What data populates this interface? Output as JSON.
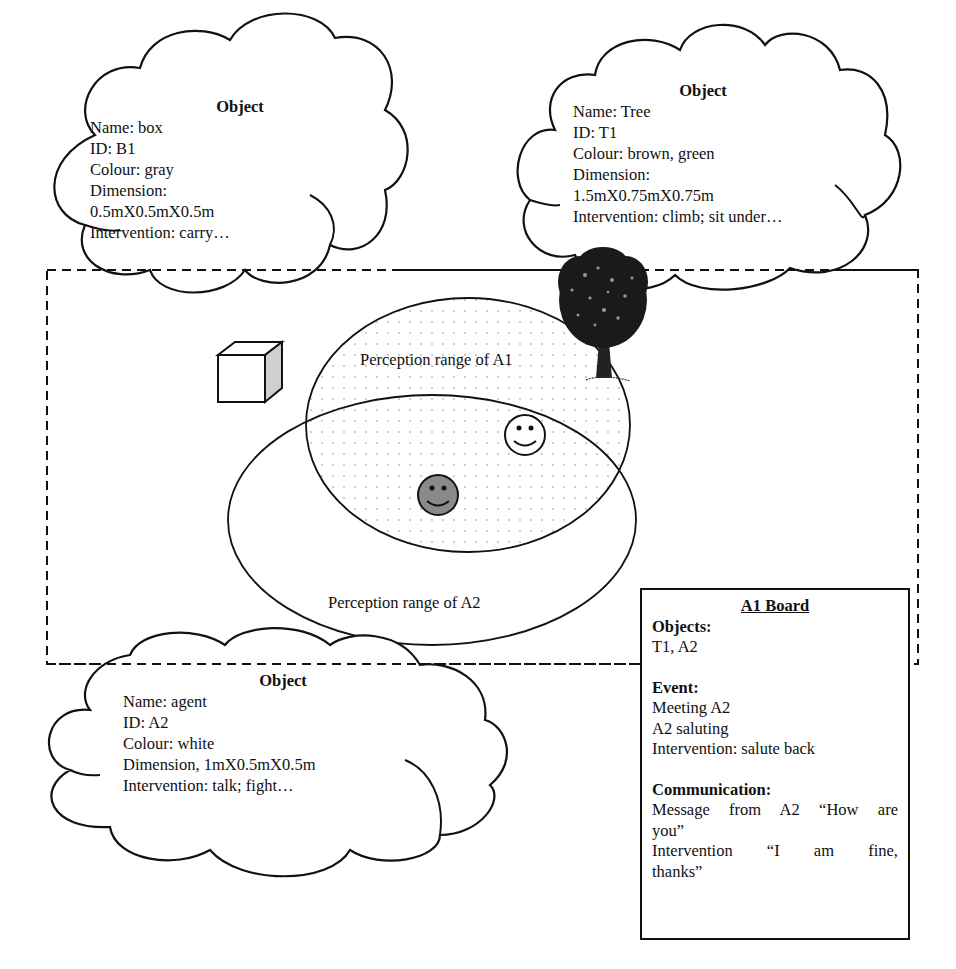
{
  "colors": {
    "stroke": "#111111",
    "agent_a2_fill": "#8a8a8a",
    "box_side_fill": "#cfcfcf",
    "perception_dots": "#bdbdbd",
    "background": "#ffffff"
  },
  "objects": [
    {
      "title": "Object",
      "lines": [
        "Name: box",
        "ID: B1",
        "Colour: gray",
        "Dimension:",
        "0.5mX0.5mX0.5m",
        "Intervention: carry…"
      ]
    },
    {
      "title": "Object",
      "lines": [
        "Name: Tree",
        "ID: T1",
        "Colour: brown, green",
        "Dimension:",
        "1.5mX0.75mX0.75m",
        "Intervention: climb; sit under…"
      ]
    },
    {
      "title": "Object",
      "lines": [
        "Name: agent",
        "ID: A2",
        "Colour: white",
        "Dimension, 1mX0.5mX0.5m",
        "Intervention: talk; fight…"
      ]
    }
  ],
  "scene": {
    "perception_a1_label": "Perception range of A1",
    "perception_a2_label": "Perception range of A2",
    "icons": [
      "box-icon",
      "tree-icon",
      "agent-a1-smiley-icon",
      "agent-a2-smiley-icon"
    ]
  },
  "board": {
    "title": "A1 Board",
    "objects_heading": "Objects:",
    "objects_value": "T1, A2",
    "event_heading": "Event:",
    "event_lines": [
      "Meeting A2",
      "A2 saluting",
      "Intervention: salute back"
    ],
    "communication_heading": "Communication:",
    "communication_line1": "Message from A2 “How are",
    "communication_line2": "you”",
    "communication_line3": "Intervention “I am fine,",
    "communication_line4": "thanks”"
  }
}
